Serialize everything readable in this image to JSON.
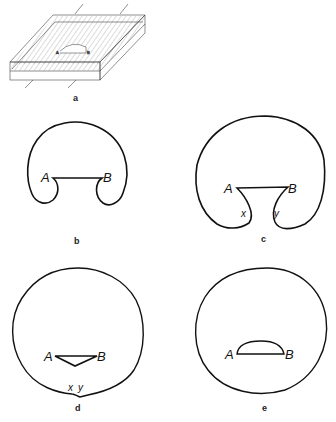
{
  "figure": {
    "panels": [
      {
        "id": "a",
        "caption": "a",
        "description": "slab in perspective with hatched layer",
        "point_labels": {
          "A": "A",
          "B": "B"
        }
      },
      {
        "id": "b",
        "caption": "b",
        "point_labels": {
          "A": "A",
          "B": "B"
        }
      },
      {
        "id": "c",
        "caption": "c",
        "point_labels": {
          "A": "A",
          "B": "B",
          "x": "x",
          "y": "y"
        }
      },
      {
        "id": "d",
        "caption": "d",
        "point_labels": {
          "A": "A",
          "B": "B",
          "x": "x",
          "y": "y"
        }
      },
      {
        "id": "e",
        "caption": "e",
        "point_labels": {
          "A": "A",
          "B": "B"
        }
      }
    ],
    "colors": {
      "stroke": "#111111",
      "hatch": "#777777",
      "background": "#ffffff"
    }
  }
}
